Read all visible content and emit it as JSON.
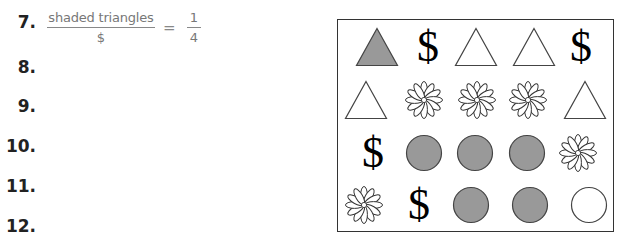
{
  "questions": [
    {
      "number": "7.",
      "numerator": "shaded triangles",
      "denominator": "$",
      "equals": "=",
      "answer_numerator": "1",
      "answer_denominator": "4"
    },
    {
      "number": "8."
    },
    {
      "number": "9."
    },
    {
      "number": "10."
    },
    {
      "number": "11."
    },
    {
      "number": "12."
    }
  ],
  "colors": {
    "shaded_fill": "#999999",
    "outline": "#444444",
    "box_border": "#333333"
  },
  "grid": {
    "rows": [
      [
        {
          "shape": "triangle",
          "shaded": true,
          "icon": "shaded-triangle-icon"
        },
        {
          "shape": "dollar",
          "symbol": "$",
          "icon": "dollar-sign-icon"
        },
        {
          "shape": "triangle",
          "shaded": false,
          "icon": "triangle-icon"
        },
        {
          "shape": "triangle",
          "shaded": false,
          "icon": "triangle-icon"
        },
        {
          "shape": "dollar",
          "symbol": "$",
          "icon": "dollar-sign-icon"
        }
      ],
      [
        {
          "shape": "triangle",
          "shaded": false,
          "icon": "triangle-icon"
        },
        {
          "shape": "flower",
          "icon": "flower-icon"
        },
        {
          "shape": "flower",
          "icon": "flower-icon"
        },
        {
          "shape": "flower",
          "icon": "flower-icon"
        },
        {
          "shape": "triangle",
          "shaded": false,
          "icon": "triangle-icon"
        }
      ],
      [
        {
          "shape": "dollar",
          "symbol": "$",
          "icon": "dollar-sign-icon"
        },
        {
          "shape": "circle",
          "shaded": true,
          "icon": "shaded-circle-icon"
        },
        {
          "shape": "circle",
          "shaded": true,
          "icon": "shaded-circle-icon"
        },
        {
          "shape": "circle",
          "shaded": true,
          "icon": "shaded-circle-icon"
        },
        {
          "shape": "flower",
          "icon": "flower-icon"
        }
      ],
      [
        {
          "shape": "flower",
          "icon": "flower-icon"
        },
        {
          "shape": "dollar",
          "symbol": "$",
          "icon": "dollar-sign-icon"
        },
        {
          "shape": "circle",
          "shaded": true,
          "icon": "shaded-circle-icon"
        },
        {
          "shape": "circle",
          "shaded": true,
          "icon": "shaded-circle-icon"
        },
        {
          "shape": "circle",
          "shaded": false,
          "icon": "circle-icon"
        }
      ]
    ]
  }
}
